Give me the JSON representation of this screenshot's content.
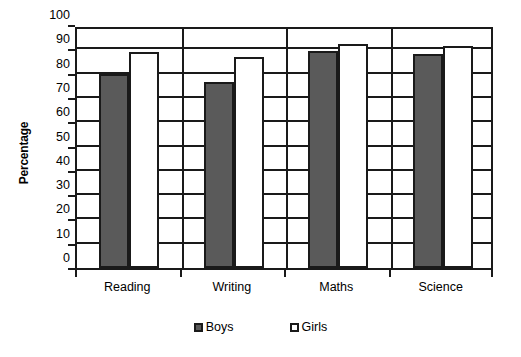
{
  "chart_data": {
    "type": "bar",
    "title": "",
    "xlabel": "",
    "ylabel": "Percentage",
    "categories": [
      "Reading",
      "Writing",
      "Maths",
      "Science"
    ],
    "series": [
      {
        "name": "Boys",
        "color": "#5a5a5a",
        "values": [
          80,
          76.5,
          89.5,
          88
        ]
      },
      {
        "name": "Girls",
        "color": "#ffffff",
        "values": [
          89,
          87,
          92,
          91.5
        ]
      }
    ],
    "ylim": [
      0,
      100
    ],
    "ytick_step": 10,
    "yticks": [
      0,
      10,
      20,
      30,
      40,
      50,
      60,
      70,
      80,
      90,
      100
    ],
    "ytick_labels": [
      "0",
      "10",
      "20",
      "30",
      "40",
      "50",
      "60",
      "70",
      "80",
      "90",
      "100"
    ],
    "grid": true,
    "grid_axis": "y",
    "legend": true,
    "legend_position": "bottom",
    "legend_entries": [
      "Boys",
      "Girls"
    ],
    "bar_border_color": "#1a1a1a",
    "axis_color": "#1a1a1a",
    "background": "#ffffff"
  },
  "axis": {
    "y_title": "Percentage"
  }
}
